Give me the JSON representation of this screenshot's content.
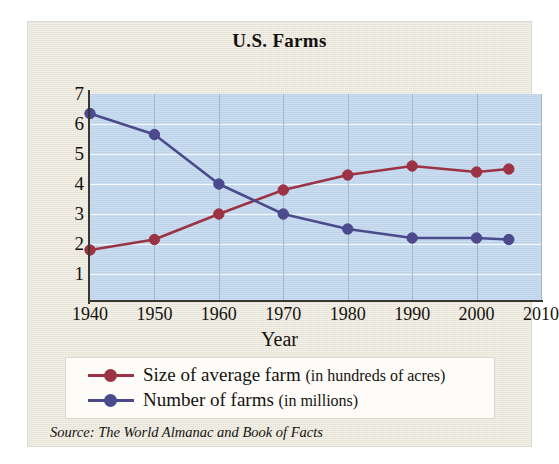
{
  "chart_data": {
    "type": "line",
    "title": "U.S. Farms",
    "xlabel": "Year",
    "ylabel": "",
    "xlim": [
      1940,
      2010
    ],
    "ylim": [
      0,
      7
    ],
    "xticks": [
      1940,
      1950,
      1960,
      1970,
      1980,
      1990,
      2000,
      2010
    ],
    "yticks": [
      1,
      2,
      3,
      4,
      5,
      6,
      7
    ],
    "grid": true,
    "legend_position": "bottom",
    "source": "Source: The World Almanac and Book of Facts",
    "series": [
      {
        "name": "Size of average farm (in hundreds of acres)",
        "name_main": "Size of average farm",
        "name_paren": "(in hundreds of acres)",
        "color": "#9b3344",
        "x": [
          1940,
          1950,
          1960,
          1970,
          1980,
          1990,
          2000,
          2005
        ],
        "values": [
          1.8,
          2.15,
          3.0,
          3.8,
          4.3,
          4.6,
          4.4,
          4.5
        ]
      },
      {
        "name": "Number of farms (in millions)",
        "name_main": "Number of farms",
        "name_paren": "(in millions)",
        "color": "#4a4a8c",
        "x": [
          1940,
          1950,
          1960,
          1970,
          1980,
          1990,
          2000,
          2005
        ],
        "values": [
          6.35,
          5.65,
          4.0,
          3.0,
          2.5,
          2.2,
          2.2,
          2.15
        ]
      }
    ]
  },
  "colors": {
    "card_background": "#ebe7da",
    "plot_background": "#c3d8ee",
    "axis": "#3a3630",
    "hgrid": "#f4f8fc",
    "vgrid": "#9fb7d2",
    "legend_background": "#fdfcf8",
    "text": "#15120e"
  }
}
